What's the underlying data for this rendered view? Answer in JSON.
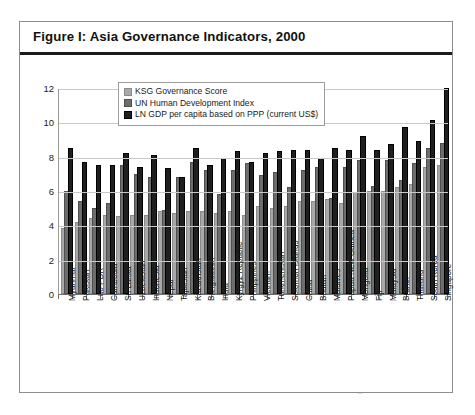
{
  "figure": {
    "title": "Figure I: Asia Governance Indicators, 2000"
  },
  "legend": {
    "position": "top-center-inside",
    "items": [
      {
        "label": "KSG Governance Score",
        "color": "#a8a8a8"
      },
      {
        "label": "UN Human Development Index",
        "color": "#6d6d6d"
      },
      {
        "label": "LN GDP per capita based on PPP (current US$)",
        "color": "#1f1f1f"
      }
    ]
  },
  "axis": {
    "yticks": [
      "0",
      "2",
      "4",
      "6",
      "8",
      "10",
      "12"
    ]
  },
  "chart_data": {
    "type": "bar",
    "title": "Figure I: Asia Governance Indicators, 2000",
    "xlabel": "",
    "ylabel": "",
    "ylim": [
      0,
      12
    ],
    "ytick_step": 2,
    "grid": true,
    "legend_position": "top-center-inside",
    "categories": [
      "Myanmar",
      "Pakistan",
      "Lao PDR",
      "Cambodia",
      "Sri Lanka",
      "Uzbekistan",
      "Indonesia",
      "Nepal",
      "Tajikistan",
      "Kazakhstan",
      "Bangladesh",
      "India",
      "Kyrgyz Republic",
      "Philippines",
      "Vietnam",
      "Turkmenistan",
      "Solomon Islands",
      "China",
      "Bhutan",
      "Maldives",
      "Papua New Guinea",
      "Mongolia",
      "Fiji",
      "Malaysia",
      "Brunei",
      "Thailand",
      "South Korea",
      "Singapore"
    ],
    "series": [
      {
        "name": "KSG Governance Score",
        "color": "#a8a8a8",
        "values": [
          3.7,
          4.1,
          4.3,
          4.5,
          4.4,
          4.5,
          4.5,
          4.7,
          4.6,
          4.7,
          4.7,
          4.6,
          4.7,
          4.5,
          5.0,
          4.9,
          5.0,
          5.3,
          5.3,
          5.4,
          5.2,
          5.8,
          5.9,
          5.9,
          6.1,
          6.3,
          7.3,
          7.4
        ]
      },
      {
        "name": "UN Human Development Index",
        "color": "#6d6d6d",
        "values": [
          5.9,
          5.3,
          4.9,
          5.2,
          7.4,
          6.9,
          6.7,
          4.8,
          6.7,
          7.6,
          7.1,
          5.7,
          7.1,
          7.5,
          6.8,
          7.0,
          6.1,
          7.1,
          7.3,
          5.5,
          7.3,
          7.7,
          6.2,
          7.7,
          6.5,
          7.5,
          8.4,
          8.7
        ]
      },
      {
        "name": "LN GDP per capita based on PPP (current US$)",
        "color": "#1f1f1f",
        "values": [
          8.4,
          7.6,
          7.4,
          7.4,
          8.1,
          7.3,
          8.0,
          7.2,
          6.7,
          8.4,
          7.4,
          7.8,
          8.2,
          7.6,
          8.1,
          8.2,
          8.3,
          8.3,
          7.8,
          8.4,
          8.3,
          9.1,
          8.3,
          8.6,
          9.6,
          8.8,
          10.0,
          11.9
        ]
      }
    ]
  }
}
